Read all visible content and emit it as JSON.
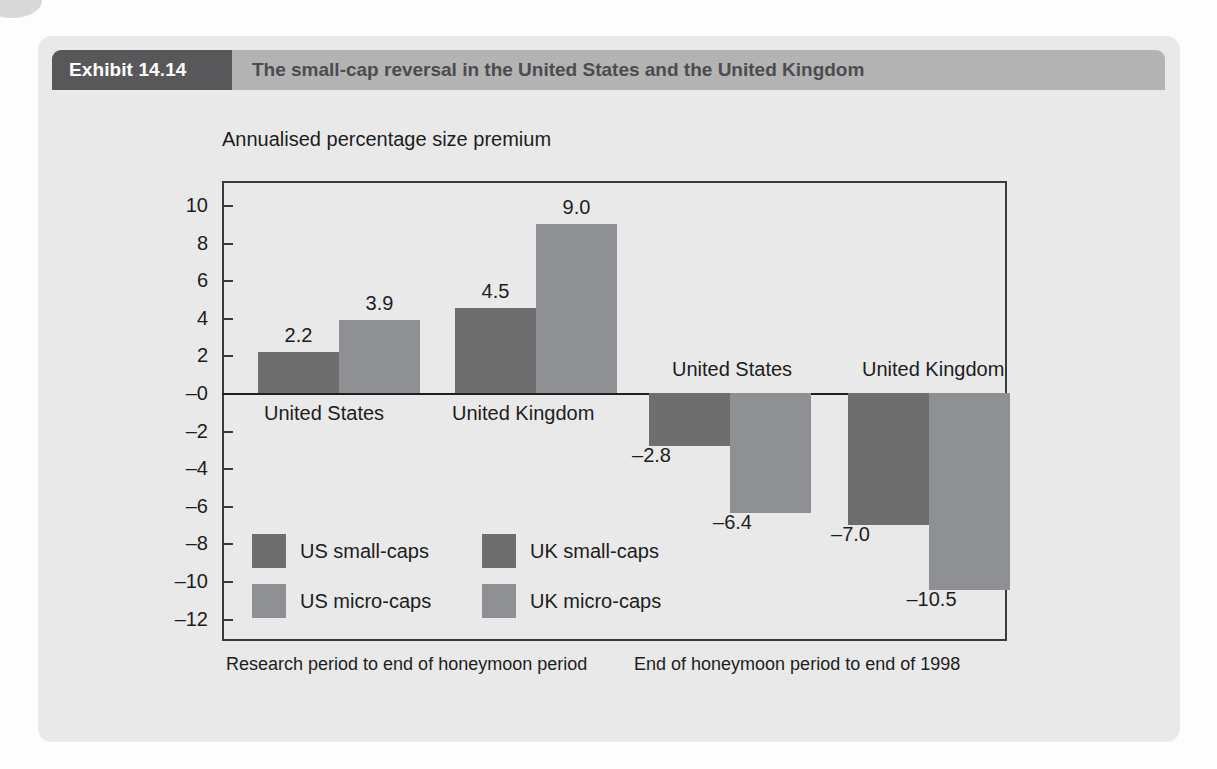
{
  "exhibit": {
    "tag": "Exhibit 14.14",
    "title": "The small-cap reversal in the United States and the United Kingdom"
  },
  "colors": {
    "tag_bg": "#58585a",
    "title_bg": "#b3b3b3",
    "panel_bg": "#e9e9e9",
    "small_caps": "#6e6e6e",
    "micro_caps": "#8e9093",
    "axis": "#3a3a3a"
  },
  "chart_data": {
    "type": "bar",
    "title": "The small-cap reversal in the United States and the United Kingdom",
    "ylabel": "Annualised percentage size premium",
    "xlabel": "",
    "ylim": [
      -12,
      10
    ],
    "ytick_step": 2,
    "ytick_labels": [
      "10",
      "8",
      "6",
      "4",
      "2",
      "–0",
      "–2",
      "–4",
      "–6",
      "–8",
      "–10",
      "–12"
    ],
    "yticks": [
      10,
      8,
      6,
      4,
      2,
      0,
      -2,
      -4,
      -6,
      -8,
      -10,
      -12
    ],
    "grid": false,
    "legend_position": "inside-lower-left",
    "categories": [
      "United States",
      "United Kingdom",
      "United States",
      "United Kingdom"
    ],
    "series": [
      {
        "name": "US small-caps",
        "color": "#6e6e6e",
        "values": [
          2.2,
          null,
          -2.8,
          null
        ]
      },
      {
        "name": "US micro-caps",
        "color": "#8e9093",
        "values": [
          3.9,
          null,
          -6.4,
          null
        ]
      },
      {
        "name": "UK small-caps",
        "color": "#6e6e6e",
        "values": [
          null,
          4.5,
          null,
          -7.0
        ]
      },
      {
        "name": "UK micro-caps",
        "color": "#8e9093",
        "values": [
          null,
          9.0,
          null,
          -10.5
        ]
      }
    ],
    "bars": [
      {
        "label": "2.2",
        "value": 2.2,
        "series": "US small-caps",
        "group": "United States",
        "period": "Research period to end of honeymoon period"
      },
      {
        "label": "3.9",
        "value": 3.9,
        "series": "US micro-caps",
        "group": "United States",
        "period": "Research period to end of honeymoon period"
      },
      {
        "label": "4.5",
        "value": 4.5,
        "series": "UK small-caps",
        "group": "United Kingdom",
        "period": "Research period to end of honeymoon period"
      },
      {
        "label": "9.0",
        "value": 9.0,
        "series": "UK micro-caps",
        "group": "United Kingdom",
        "period": "Research period to end of honeymoon period"
      },
      {
        "label": "–2.8",
        "value": -2.8,
        "series": "US small-caps",
        "group": "United States",
        "period": "End of honeymoon period to end of 1998"
      },
      {
        "label": "–6.4",
        "value": -6.4,
        "series": "US micro-caps",
        "group": "United States",
        "period": "End of honeymoon period to end of 1998"
      },
      {
        "label": "–7.0",
        "value": -7.0,
        "series": "UK small-caps",
        "group": "United Kingdom",
        "period": "End of honeymoon period to end of 1998"
      },
      {
        "label": "–10.5",
        "value": -10.5,
        "series": "UK micro-caps",
        "group": "United Kingdom",
        "period": "End of honeymoon period to end of 1998"
      }
    ],
    "group_labels": [
      {
        "text": "United States",
        "side": "positive"
      },
      {
        "text": "United Kingdom",
        "side": "positive"
      },
      {
        "text": "United States",
        "side": "negative"
      },
      {
        "text": "United Kingdom",
        "side": "negative"
      }
    ],
    "legend": [
      {
        "name": "US small-caps",
        "color": "#6e6e6e"
      },
      {
        "name": "US micro-caps",
        "color": "#8e9093"
      },
      {
        "name": "UK small-caps",
        "color": "#6e6e6e"
      },
      {
        "name": "UK micro-caps",
        "color": "#8e9093"
      }
    ],
    "period_captions": [
      "Research period to end of honeymoon period",
      "End of honeymoon period to end of 1998"
    ]
  }
}
